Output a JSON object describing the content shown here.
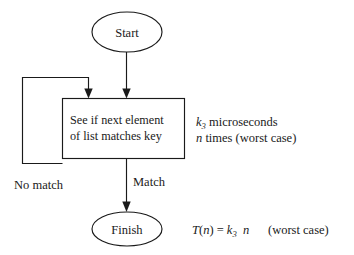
{
  "diagram": {
    "type": "flowchart",
    "background_color": "#ffffff",
    "stroke_color": "#1a1a1a",
    "nodes": {
      "start": {
        "label": "Start",
        "shape": "ellipse"
      },
      "process": {
        "line1": "See if next element",
        "line2": "of list matches key",
        "shape": "rectangle"
      },
      "finish": {
        "label": "Finish",
        "shape": "ellipse"
      }
    },
    "edge_labels": {
      "no_match": "No match",
      "match": "Match"
    },
    "annotations": {
      "cost_line1_var": "k",
      "cost_line1_sub": "3",
      "cost_line1_unit": "microseconds",
      "cost_line2_var": "n",
      "cost_line2_rest": "times (worst case)",
      "formula_t": "T",
      "formula_open": "(",
      "formula_arg": "n",
      "formula_close": ")",
      "formula_eq": "=",
      "formula_k": "k",
      "formula_k_sub": "3",
      "formula_n": "n",
      "formula_note": "(worst case)"
    }
  }
}
